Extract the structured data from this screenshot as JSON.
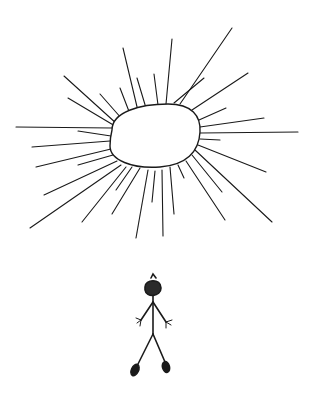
{
  "scene": {
    "description": "Hand-drawn sketch of a large radiating sun above a small stick figure",
    "colors": {
      "background": "#ffffff",
      "ink": "#1a1a1a"
    }
  }
}
